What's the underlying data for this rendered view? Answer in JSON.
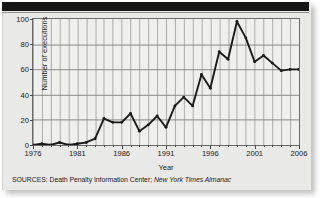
{
  "figure": {
    "source_prefix": "SOURCES:",
    "source_primary": "Death Penalty Information Center;",
    "source_secondary": "New York Times Almanac"
  },
  "chart_data": {
    "type": "line",
    "title": "",
    "xlabel": "Year",
    "ylabel": "Number of executions",
    "xlim": [
      1976,
      2006
    ],
    "ylim": [
      0,
      100
    ],
    "ytick_labels": [
      "0",
      "20",
      "40",
      "60",
      "80",
      "100"
    ],
    "yticks": [
      0,
      20,
      40,
      60,
      80,
      100
    ],
    "xtick_labels": [
      "1976",
      "1981",
      "1986",
      "1991",
      "1996",
      "2001",
      "2006"
    ],
    "xticks": [
      1976,
      1981,
      1986,
      1991,
      1996,
      2001,
      2006
    ],
    "grid": "both",
    "grid_x_interval": 1,
    "grid_y_interval": 20,
    "legend": "none",
    "line_color": "#1a1a1a",
    "marker": "dot",
    "x": [
      1976,
      1977,
      1978,
      1979,
      1980,
      1981,
      1982,
      1983,
      1984,
      1985,
      1986,
      1987,
      1988,
      1989,
      1990,
      1991,
      1992,
      1993,
      1994,
      1995,
      1996,
      1997,
      1998,
      1999,
      2000,
      2001,
      2002,
      2003,
      2004,
      2005,
      2006
    ],
    "values": [
      0,
      1,
      0,
      2,
      0,
      1,
      2,
      5,
      21,
      18,
      18,
      25,
      11,
      16,
      23,
      14,
      31,
      38,
      31,
      56,
      45,
      74,
      68,
      98,
      85,
      66,
      71,
      65,
      59,
      60,
      60
    ],
    "series": [
      {
        "name": "Number of executions",
        "values": [
          0,
          1,
          0,
          2,
          0,
          1,
          2,
          5,
          21,
          18,
          18,
          25,
          11,
          16,
          23,
          14,
          31,
          38,
          31,
          56,
          45,
          74,
          68,
          98,
          85,
          66,
          71,
          65,
          59,
          60,
          60
        ]
      }
    ]
  }
}
